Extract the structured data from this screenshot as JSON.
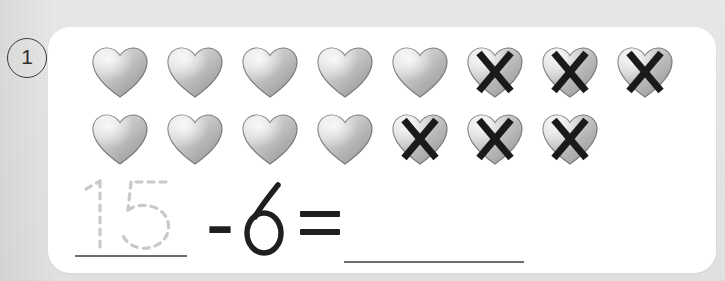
{
  "worksheet": {
    "problem_number": "1",
    "background_color": "#e8e8e6",
    "card_color": "#ffffff"
  },
  "problem": {
    "type": "subtraction-with-pictures",
    "icon_name": "heart-icon",
    "cross_icon_name": "cross-out-x-icon",
    "total_objects": 15,
    "crossed_out_objects": 6,
    "remaining_objects": 9,
    "rows": [
      {
        "row_index": 0,
        "count": 8,
        "hearts": [
          {
            "index": 0,
            "crossed_out": false
          },
          {
            "index": 1,
            "crossed_out": false
          },
          {
            "index": 2,
            "crossed_out": false
          },
          {
            "index": 3,
            "crossed_out": false
          },
          {
            "index": 4,
            "crossed_out": false
          },
          {
            "index": 5,
            "crossed_out": true
          },
          {
            "index": 6,
            "crossed_out": true
          },
          {
            "index": 7,
            "crossed_out": true
          }
        ]
      },
      {
        "row_index": 1,
        "count": 7,
        "hearts": [
          {
            "index": 0,
            "crossed_out": false
          },
          {
            "index": 1,
            "crossed_out": false
          },
          {
            "index": 2,
            "crossed_out": false
          },
          {
            "index": 3,
            "crossed_out": false
          },
          {
            "index": 4,
            "crossed_out": true
          },
          {
            "index": 5,
            "crossed_out": true
          },
          {
            "index": 6,
            "crossed_out": true
          }
        ]
      }
    ]
  },
  "equation": {
    "minuend_traced": "15",
    "minuend_style": "dashed-trace-guide",
    "minuend_color": "#c9c9c9",
    "operator": "–",
    "subtrahend": "6",
    "equals": "=",
    "answer": "",
    "answer_placeholder": "",
    "ink_color": "#1f1f1f",
    "rule_color": "#6e6e6e"
  },
  "colors": {
    "heart_light": "#f0f0f0",
    "heart_mid": "#c8c8c8",
    "heart_dark": "#8f8f8f",
    "heart_outline": "#7a7a7a",
    "cross_color": "#1a1a1a",
    "page_bg": "#e8e8e6",
    "badge_stroke": "#3a3a3a"
  }
}
